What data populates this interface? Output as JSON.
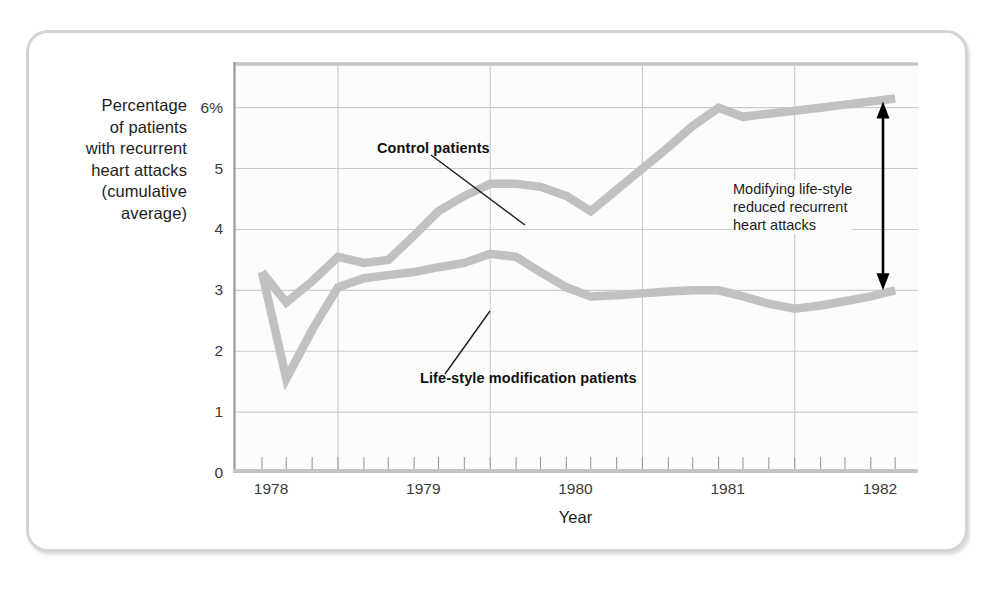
{
  "figure": {
    "y_axis_caption_lines": [
      "Percentage",
      "of patients",
      "with recurrent",
      "heart attacks",
      "(cumulative",
      "average)"
    ],
    "x_axis_title": "Year",
    "annotations": {
      "control_label": "Control patients",
      "lifestyle_label": "Life-style modification patients",
      "bracket_note_lines": [
        "Modifying life-style",
        "reduced recurrent",
        "heart attacks"
      ]
    },
    "colors": {
      "series_line": "#bfc1c3",
      "grid": "#c9cbcd",
      "axis": "#9a9c9e",
      "text": "#1d1d1b",
      "frame": "#d2d4d6",
      "plot_background": "#fcfcfc"
    }
  },
  "chart_data": {
    "type": "line",
    "title": "",
    "subtitle": "",
    "xlabel": "Year",
    "ylabel": "Percentage of patients with recurrent heart attacks (cumulative average)",
    "xlim": [
      1977.75,
      1982.25
    ],
    "ylim": [
      0,
      6.75
    ],
    "yticks": [
      0,
      1,
      2,
      3,
      4,
      5,
      6
    ],
    "ytick_labels": [
      "0",
      "1",
      "2",
      "3",
      "4",
      "5",
      "6%"
    ],
    "xticks": [
      1978,
      1979,
      1980,
      1981,
      1982
    ],
    "xtick_labels": [
      "1978",
      "1979",
      "1980",
      "1981",
      "1982"
    ],
    "grid": true,
    "legend": "inline annotations",
    "x": [
      1977.94,
      1978.1,
      1978.27,
      1978.44,
      1978.61,
      1978.77,
      1978.94,
      1979.1,
      1979.27,
      1979.44,
      1979.61,
      1979.77,
      1979.94,
      1980.1,
      1980.27,
      1980.44,
      1980.61,
      1980.77,
      1980.94,
      1981.1,
      1981.27,
      1981.44,
      1981.61,
      1981.77,
      1981.94,
      1982.1
    ],
    "series": [
      {
        "name": "Control patients",
        "values": [
          3.3,
          2.8,
          3.15,
          3.55,
          3.45,
          3.5,
          3.9,
          4.3,
          4.55,
          4.75,
          4.75,
          4.7,
          4.55,
          4.3,
          4.65,
          5.0,
          5.35,
          5.7,
          6.0,
          5.85,
          5.9,
          5.95,
          6.0,
          6.05,
          6.1,
          6.15
        ]
      },
      {
        "name": "Life-style modification patients",
        "values": [
          3.3,
          1.55,
          2.35,
          3.05,
          3.2,
          3.25,
          3.3,
          3.38,
          3.45,
          3.6,
          3.55,
          3.3,
          3.05,
          2.9,
          2.92,
          2.95,
          2.98,
          3.0,
          3.0,
          2.9,
          2.78,
          2.7,
          2.75,
          2.82,
          2.9,
          3.0
        ]
      }
    ],
    "annotations": [
      {
        "text": "Control patients",
        "target_series": "Control patients",
        "target_x": 1979.45,
        "target_y": 4.6
      },
      {
        "text": "Life-style modification patients",
        "target_series": "Life-style modification patients",
        "target_x": 1979.3,
        "target_y": 3.35
      },
      {
        "text": "Modifying life-style reduced recurrent heart attacks",
        "type": "double-arrow-bracket",
        "x": 1982.02,
        "y_top": 6.1,
        "y_bottom": 3.0
      }
    ]
  }
}
